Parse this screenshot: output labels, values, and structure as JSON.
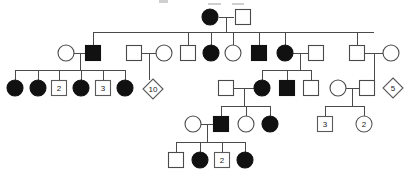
{
  "figure": {
    "type": "pedigree",
    "symbol_legend": {
      "filled_circle": "affected female",
      "open_circle": "unaffected female",
      "filled_square": "affected male",
      "open_square": "unaffected male",
      "diamond": "sibship of unspecified sex",
      "number_in_symbol": "number of individuals represented"
    },
    "colors": {
      "affected_fill": "#111111",
      "unaffected_fill": "#ffffff",
      "stroke": "#4a4a4a",
      "background": "#ffffff"
    }
  },
  "generations": [
    {
      "id": "I",
      "label": "I",
      "members": [
        {
          "id": "I-1",
          "shape": "circle",
          "status": "affected",
          "sex": "female",
          "x": 210,
          "y": 17,
          "count": ""
        },
        {
          "id": "I-2",
          "shape": "square",
          "status": "unaffected",
          "sex": "male",
          "x": 243,
          "y": 17,
          "count": ""
        }
      ]
    },
    {
      "id": "II",
      "label": "II",
      "members": [
        {
          "id": "II-1",
          "shape": "circle",
          "status": "unaffected",
          "sex": "female",
          "x": 66,
          "y": 53,
          "count": ""
        },
        {
          "id": "II-2",
          "shape": "square",
          "status": "affected",
          "sex": "male",
          "x": 93,
          "y": 53,
          "count": ""
        },
        {
          "id": "II-3",
          "shape": "square",
          "status": "unaffected",
          "sex": "male",
          "x": 134,
          "y": 53,
          "count": ""
        },
        {
          "id": "II-4",
          "shape": "circle",
          "status": "unaffected",
          "sex": "female",
          "x": 164,
          "y": 53,
          "count": ""
        },
        {
          "id": "II-5",
          "shape": "square",
          "status": "unaffected",
          "sex": "male",
          "x": 188,
          "y": 53,
          "count": ""
        },
        {
          "id": "II-6",
          "shape": "circle",
          "status": "affected",
          "sex": "female",
          "x": 211,
          "y": 53,
          "count": ""
        },
        {
          "id": "II-7",
          "shape": "circle",
          "status": "unaffected",
          "sex": "female",
          "x": 233,
          "y": 53,
          "count": ""
        },
        {
          "id": "II-8",
          "shape": "square",
          "status": "affected",
          "sex": "male",
          "x": 259,
          "y": 53,
          "count": ""
        },
        {
          "id": "II-9",
          "shape": "circle",
          "status": "affected",
          "sex": "female",
          "x": 285,
          "y": 53,
          "count": ""
        },
        {
          "id": "II-10",
          "shape": "square",
          "status": "unaffected",
          "sex": "male",
          "x": 316,
          "y": 53,
          "count": ""
        },
        {
          "id": "II-11",
          "shape": "square",
          "status": "unaffected",
          "sex": "male",
          "x": 357,
          "y": 53,
          "count": ""
        },
        {
          "id": "II-12",
          "shape": "circle",
          "status": "unaffected",
          "sex": "female",
          "x": 391,
          "y": 53,
          "count": ""
        }
      ]
    },
    {
      "id": "III",
      "label": "III",
      "members": [
        {
          "id": "III-1",
          "shape": "circle",
          "status": "affected",
          "sex": "female",
          "x": 15,
          "y": 88,
          "count": ""
        },
        {
          "id": "III-2",
          "shape": "circle",
          "status": "affected",
          "sex": "female",
          "x": 38,
          "y": 88,
          "count": ""
        },
        {
          "id": "III-3",
          "shape": "square",
          "status": "count",
          "sex": "male",
          "x": 59,
          "y": 88,
          "count": "2"
        },
        {
          "id": "III-4",
          "shape": "circle",
          "status": "affected",
          "sex": "female",
          "x": 81,
          "y": 88,
          "count": ""
        },
        {
          "id": "III-5",
          "shape": "square",
          "status": "count",
          "sex": "male",
          "x": 103,
          "y": 88,
          "count": "3"
        },
        {
          "id": "III-6",
          "shape": "circle",
          "status": "affected",
          "sex": "female",
          "x": 125,
          "y": 88,
          "count": ""
        },
        {
          "id": "III-7",
          "shape": "diamond",
          "status": "count",
          "sex": "unknown",
          "x": 153,
          "y": 89,
          "count": "10"
        },
        {
          "id": "III-8",
          "shape": "square",
          "status": "unaffected",
          "sex": "male",
          "x": 226,
          "y": 88,
          "count": ""
        },
        {
          "id": "III-9",
          "shape": "circle",
          "status": "affected",
          "sex": "female",
          "x": 262,
          "y": 88,
          "count": ""
        },
        {
          "id": "III-10",
          "shape": "square",
          "status": "affected",
          "sex": "male",
          "x": 287,
          "y": 88,
          "count": ""
        },
        {
          "id": "III-11",
          "shape": "square",
          "status": "unaffected",
          "sex": "male",
          "x": 311,
          "y": 88,
          "count": ""
        },
        {
          "id": "III-12",
          "shape": "circle",
          "status": "unaffected",
          "sex": "female",
          "x": 338,
          "y": 88,
          "count": ""
        },
        {
          "id": "III-13",
          "shape": "square",
          "status": "unaffected",
          "sex": "male",
          "x": 367,
          "y": 88,
          "count": ""
        },
        {
          "id": "III-14",
          "shape": "diamond",
          "status": "count",
          "sex": "unknown",
          "x": 393,
          "y": 88,
          "count": "5"
        }
      ]
    },
    {
      "id": "IV",
      "label": "IV",
      "members": [
        {
          "id": "IV-1",
          "shape": "circle",
          "status": "unaffected",
          "sex": "female",
          "x": 193,
          "y": 124,
          "count": ""
        },
        {
          "id": "IV-2",
          "shape": "square",
          "status": "affected",
          "sex": "male",
          "x": 221,
          "y": 124,
          "count": ""
        },
        {
          "id": "IV-3",
          "shape": "circle",
          "status": "unaffected",
          "sex": "female",
          "x": 246,
          "y": 124,
          "count": ""
        },
        {
          "id": "IV-4",
          "shape": "circle",
          "status": "affected",
          "sex": "female",
          "x": 270,
          "y": 124,
          "count": ""
        },
        {
          "id": "IV-5",
          "shape": "square",
          "status": "count",
          "sex": "male",
          "x": 325,
          "y": 124,
          "count": "3"
        },
        {
          "id": "IV-6",
          "shape": "circle",
          "status": "count",
          "sex": "female",
          "x": 364,
          "y": 124,
          "count": "2"
        }
      ]
    },
    {
      "id": "V",
      "label": "V",
      "members": [
        {
          "id": "V-1",
          "shape": "square",
          "status": "unaffected",
          "sex": "male",
          "x": 176,
          "y": 160,
          "count": ""
        },
        {
          "id": "V-2",
          "shape": "circle",
          "status": "affected",
          "sex": "female",
          "x": 200,
          "y": 160,
          "count": ""
        },
        {
          "id": "V-3",
          "shape": "square",
          "status": "count",
          "sex": "male",
          "x": 222,
          "y": 160,
          "count": "2"
        },
        {
          "id": "V-4",
          "shape": "circle",
          "status": "affected",
          "sex": "female",
          "x": 245,
          "y": 160,
          "count": ""
        }
      ]
    }
  ],
  "connectors": {
    "mating_lines": [
      {
        "id": "mate-I-1-I-2",
        "x1": 219,
        "x2": 234,
        "y": 17
      },
      {
        "id": "mate-II-1-II-2",
        "x1": 74,
        "x2": 85,
        "y": 53
      },
      {
        "id": "mate-II-3-II-4",
        "x1": 142,
        "x2": 156,
        "y": 53
      },
      {
        "id": "mate-II-9-II-10",
        "x1": 293,
        "x2": 308,
        "y": 53
      },
      {
        "id": "mate-II-11-II-12",
        "x1": 365,
        "x2": 383,
        "y": 53
      },
      {
        "id": "mate-III-8-III-9",
        "x1": 234,
        "x2": 254,
        "y": 88
      },
      {
        "id": "mate-III-12-III-13",
        "x1": 346,
        "x2": 359,
        "y": 88
      },
      {
        "id": "mate-IV-1-IV-2",
        "x1": 201,
        "x2": 213,
        "y": 124
      }
    ],
    "descent_drops": [
      {
        "id": "drop-I-couple",
        "x": 226,
        "y1": 17,
        "y2": 32
      },
      {
        "id": "drop-II-2-couple",
        "x": 80,
        "y1": 53,
        "y2": 70
      },
      {
        "id": "drop-II-4-couple",
        "x": 149,
        "y1": 53,
        "y2": 80
      },
      {
        "id": "drop-II-10-couple",
        "x": 300,
        "y1": 53,
        "y2": 70
      },
      {
        "id": "drop-II-12-couple",
        "x": 374,
        "y1": 53,
        "y2": 80
      },
      {
        "id": "drop-III-9-couple",
        "x": 244,
        "y1": 88,
        "y2": 106
      },
      {
        "id": "drop-III-13-couple",
        "x": 352,
        "y1": 88,
        "y2": 106
      },
      {
        "id": "drop-IV-2-couple",
        "x": 207,
        "y1": 124,
        "y2": 142
      }
    ],
    "sibship_bars": [
      {
        "id": "sibship-gen2",
        "y": 32,
        "x1": 93,
        "x2": 374
      },
      {
        "id": "sibship-gen3-left",
        "y": 70,
        "x1": 15,
        "x2": 125
      },
      {
        "id": "sibship-gen3-right",
        "y": 70,
        "x1": 262,
        "x2": 311
      },
      {
        "id": "sibship-gen4-mid",
        "y": 106,
        "x1": 221,
        "x2": 270
      },
      {
        "id": "sibship-gen4-right",
        "y": 106,
        "x1": 325,
        "x2": 364
      },
      {
        "id": "sibship-gen5",
        "y": 142,
        "x1": 176,
        "x2": 245
      }
    ],
    "child_stems": [
      {
        "id": "stem-II-2",
        "x": 93,
        "y1": 32,
        "y2": 45
      },
      {
        "id": "stem-II-5",
        "x": 188,
        "y1": 32,
        "y2": 45
      },
      {
        "id": "stem-II-6",
        "x": 211,
        "y1": 32,
        "y2": 45
      },
      {
        "id": "stem-II-7",
        "x": 233,
        "y1": 32,
        "y2": 45
      },
      {
        "id": "stem-II-8",
        "x": 259,
        "y1": 32,
        "y2": 45
      },
      {
        "id": "stem-II-9",
        "x": 285,
        "y1": 32,
        "y2": 45
      },
      {
        "id": "stem-II-11",
        "x": 357,
        "y1": 32,
        "y2": 45
      },
      {
        "id": "stem-III-1",
        "x": 15,
        "y1": 70,
        "y2": 80
      },
      {
        "id": "stem-III-2",
        "x": 38,
        "y1": 70,
        "y2": 80
      },
      {
        "id": "stem-III-3",
        "x": 59,
        "y1": 70,
        "y2": 81
      },
      {
        "id": "stem-III-4",
        "x": 81,
        "y1": 70,
        "y2": 80
      },
      {
        "id": "stem-III-5",
        "x": 103,
        "y1": 70,
        "y2": 81
      },
      {
        "id": "stem-III-6",
        "x": 125,
        "y1": 70,
        "y2": 80
      },
      {
        "id": "stem-III-9",
        "x": 262,
        "y1": 70,
        "y2": 80
      },
      {
        "id": "stem-III-10",
        "x": 287,
        "y1": 70,
        "y2": 80
      },
      {
        "id": "stem-III-11",
        "x": 311,
        "y1": 70,
        "y2": 80
      },
      {
        "id": "stem-IV-2",
        "x": 221,
        "y1": 106,
        "y2": 116
      },
      {
        "id": "stem-IV-3",
        "x": 246,
        "y1": 106,
        "y2": 117
      },
      {
        "id": "stem-IV-4",
        "x": 270,
        "y1": 106,
        "y2": 116
      },
      {
        "id": "stem-IV-5",
        "x": 325,
        "y1": 106,
        "y2": 118
      },
      {
        "id": "stem-IV-6",
        "x": 364,
        "y1": 106,
        "y2": 117
      },
      {
        "id": "stem-V-1",
        "x": 176,
        "y1": 142,
        "y2": 153
      },
      {
        "id": "stem-V-2",
        "x": 200,
        "y1": 142,
        "y2": 152
      },
      {
        "id": "stem-V-3",
        "x": 222,
        "y1": 142,
        "y2": 153
      },
      {
        "id": "stem-V-4",
        "x": 245,
        "y1": 142,
        "y2": 152
      }
    ]
  },
  "artifacts": {
    "top_crop_marks": [
      {
        "id": "crop-mark-1",
        "x": 159,
        "y": 0,
        "w": 9,
        "h": 3
      },
      {
        "id": "crop-mark-2",
        "x": 208,
        "y": 3,
        "w": 13,
        "h": 2
      },
      {
        "id": "crop-mark-3",
        "x": 232,
        "y": 3,
        "w": 12,
        "h": 2
      }
    ]
  }
}
